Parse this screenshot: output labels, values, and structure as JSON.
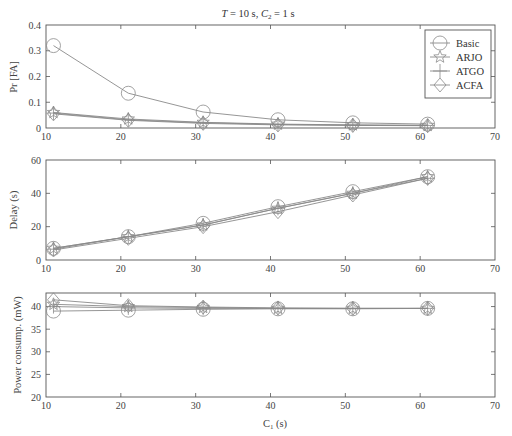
{
  "chart_data": [
    {
      "type": "line",
      "id": "false-alarm",
      "title": "T = 10 s, C2 = 1 s",
      "title_parts": {
        "T": "T",
        "T_eq": " = 10 s, ",
        "C": "C",
        "C_sub": "2",
        "C_eq": " = 1 s"
      },
      "xlabel": "",
      "ylabel": "Pr [FA]",
      "xlim": [
        10,
        70
      ],
      "ylim": [
        0,
        0.4
      ],
      "xticks": [
        10,
        20,
        30,
        40,
        50,
        60,
        70
      ],
      "yticks": [
        0,
        0.1,
        0.2,
        0.3,
        0.4
      ],
      "ytick_labels": [
        "0",
        "0.1",
        "0.2",
        "0.3",
        "0.4"
      ],
      "x": [
        11,
        21,
        31,
        41,
        51,
        61
      ],
      "series": [
        {
          "name": "Basic",
          "marker": "circle",
          "values": [
            0.32,
            0.135,
            0.062,
            0.032,
            0.02,
            0.015
          ]
        },
        {
          "name": "ARJO",
          "marker": "star",
          "values": [
            0.06,
            0.035,
            0.022,
            0.015,
            0.012,
            0.01
          ]
        },
        {
          "name": "ATGO",
          "marker": "plus",
          "values": [
            0.058,
            0.032,
            0.02,
            0.014,
            0.011,
            0.01
          ]
        },
        {
          "name": "ACFA",
          "marker": "diamond",
          "values": [
            0.055,
            0.03,
            0.018,
            0.012,
            0.01,
            0.009
          ]
        }
      ],
      "legend": {
        "position": "upper right",
        "entries": [
          "Basic",
          "ARJO",
          "ATGO",
          "ACFA"
        ]
      },
      "grid": false
    },
    {
      "type": "line",
      "id": "delay",
      "xlabel": "",
      "ylabel": "Delay (s)",
      "xlim": [
        10,
        70
      ],
      "ylim": [
        0,
        60
      ],
      "xticks": [
        10,
        20,
        30,
        40,
        50,
        60,
        70
      ],
      "yticks": [
        0,
        20,
        40,
        60
      ],
      "ytick_labels": [
        "0",
        "20",
        "40",
        "60"
      ],
      "x": [
        11,
        21,
        31,
        41,
        51,
        61
      ],
      "series": [
        {
          "name": "Basic",
          "marker": "circle",
          "values": [
            7,
            14,
            22,
            32,
            41,
            50
          ]
        },
        {
          "name": "ARJO",
          "marker": "star",
          "values": [
            7,
            14,
            21,
            31,
            40,
            50
          ]
        },
        {
          "name": "ATGO",
          "marker": "plus",
          "values": [
            6.5,
            14,
            21,
            31,
            40,
            49
          ]
        },
        {
          "name": "ACFA",
          "marker": "diamond",
          "values": [
            6,
            13,
            20,
            29,
            39,
            49
          ]
        }
      ],
      "grid": false
    },
    {
      "type": "line",
      "id": "power",
      "xlabel": "C1 (s)",
      "xlabel_parts": {
        "C": "C",
        "sub": "1",
        "rest": " (s)"
      },
      "ylabel": "Power consump. (mW)",
      "xlim": [
        10,
        70
      ],
      "ylim": [
        20,
        43
      ],
      "xticks": [
        10,
        20,
        30,
        40,
        50,
        60,
        70
      ],
      "yticks": [
        20,
        25,
        30,
        35,
        40
      ],
      "ytick_labels": [
        "20",
        "25",
        "30",
        "35",
        "40"
      ],
      "x": [
        11,
        21,
        31,
        41,
        51,
        61
      ],
      "series": [
        {
          "name": "Basic",
          "marker": "circle",
          "values": [
            39.0,
            39.2,
            39.4,
            39.5,
            39.5,
            39.6
          ]
        },
        {
          "name": "ARJO",
          "marker": "star",
          "values": [
            40.5,
            40.0,
            39.8,
            39.6,
            39.6,
            39.6
          ]
        },
        {
          "name": "ATGO",
          "marker": "plus",
          "values": [
            40.0,
            39.7,
            39.6,
            39.6,
            39.6,
            39.6
          ]
        },
        {
          "name": "ACFA",
          "marker": "diamond",
          "values": [
            41.5,
            40.2,
            39.9,
            39.7,
            39.6,
            39.6
          ]
        }
      ],
      "grid": false
    }
  ],
  "xtick_labels": [
    "10",
    "20",
    "30",
    "40",
    "50",
    "60",
    "70"
  ],
  "caption_fragment": ""
}
